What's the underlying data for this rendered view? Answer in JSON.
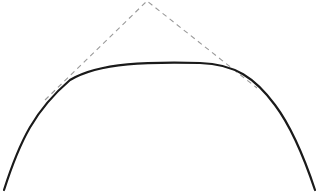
{
  "diagram": {
    "curve": {
      "color": "#1a1a1a",
      "stroke_width": 2.2,
      "path": "M 4 190 C 20 140, 35 110, 70 80 C 100 62, 150 62, 200 63 C 235 64, 255 78, 275 105 C 290 125, 305 160, 315 190"
    },
    "construction_lines": {
      "color": "#9a9a9a",
      "stroke_width": 1.1,
      "dash": "5 4",
      "apex": [
        147,
        1
      ],
      "left_start": [
        45,
        100
      ],
      "right_end": [
        257,
        88
      ]
    }
  }
}
